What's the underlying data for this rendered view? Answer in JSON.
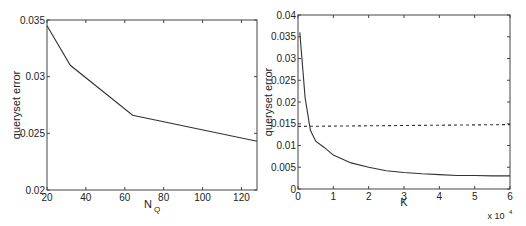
{
  "chart_data": [
    {
      "type": "line",
      "title": "",
      "xlabel": "N_Q",
      "xlabel_main": "N",
      "xlabel_sub": "Q",
      "ylabel": "queryset error",
      "xlim": [
        20,
        128
      ],
      "ylim": [
        0.02,
        0.035
      ],
      "xticks": [
        20,
        40,
        60,
        80,
        100,
        120
      ],
      "xtick_labels": [
        "20",
        "40",
        "60",
        "80",
        "100",
        "120"
      ],
      "yticks": [
        0.02,
        0.025,
        0.03,
        0.035
      ],
      "ytick_labels": [
        "0.02",
        "0.025",
        "0.03",
        "0.035"
      ],
      "grid": false,
      "legend": null,
      "series": [
        {
          "name": "queryset error",
          "style": "solid",
          "color": "#333333",
          "x": [
            20,
            32,
            64,
            128
          ],
          "y": [
            0.0345,
            0.031,
            0.0266,
            0.0243
          ]
        }
      ]
    },
    {
      "type": "line",
      "title": "",
      "xlabel": "K",
      "ylabel": "queryset error",
      "x_multiplier_label": "x 10",
      "x_multiplier_exp": "4",
      "xlim": [
        0,
        6
      ],
      "ylim": [
        0,
        0.04
      ],
      "xticks": [
        0,
        1,
        2,
        3,
        4,
        5,
        6
      ],
      "xtick_labels": [
        "0",
        "1",
        "2",
        "3",
        "4",
        "5",
        "6"
      ],
      "yticks": [
        0,
        0.005,
        0.01,
        0.015,
        0.02,
        0.025,
        0.03,
        0.035,
        0.04
      ],
      "ytick_labels": [
        "0",
        "0.005",
        "0.01",
        "0.015",
        "0.02",
        "0.025",
        "0.03",
        "0.035",
        "0.04"
      ],
      "grid": false,
      "legend": null,
      "series": [
        {
          "name": "queryset error",
          "style": "solid",
          "color": "#333333",
          "x": [
            0.05,
            0.2,
            0.35,
            0.5,
            0.75,
            1.0,
            1.5,
            2.0,
            2.5,
            3.0,
            3.5,
            4.0,
            4.5,
            5.0,
            5.5,
            6.0
          ],
          "y": [
            0.036,
            0.021,
            0.0135,
            0.011,
            0.0095,
            0.0078,
            0.006,
            0.005,
            0.0042,
            0.0038,
            0.0035,
            0.0033,
            0.0031,
            0.0031,
            0.003,
            0.003
          ]
        },
        {
          "name": "reference",
          "style": "dashed",
          "color": "#333333",
          "x": [
            0,
            6
          ],
          "y": [
            0.0144,
            0.0148
          ]
        }
      ]
    }
  ]
}
